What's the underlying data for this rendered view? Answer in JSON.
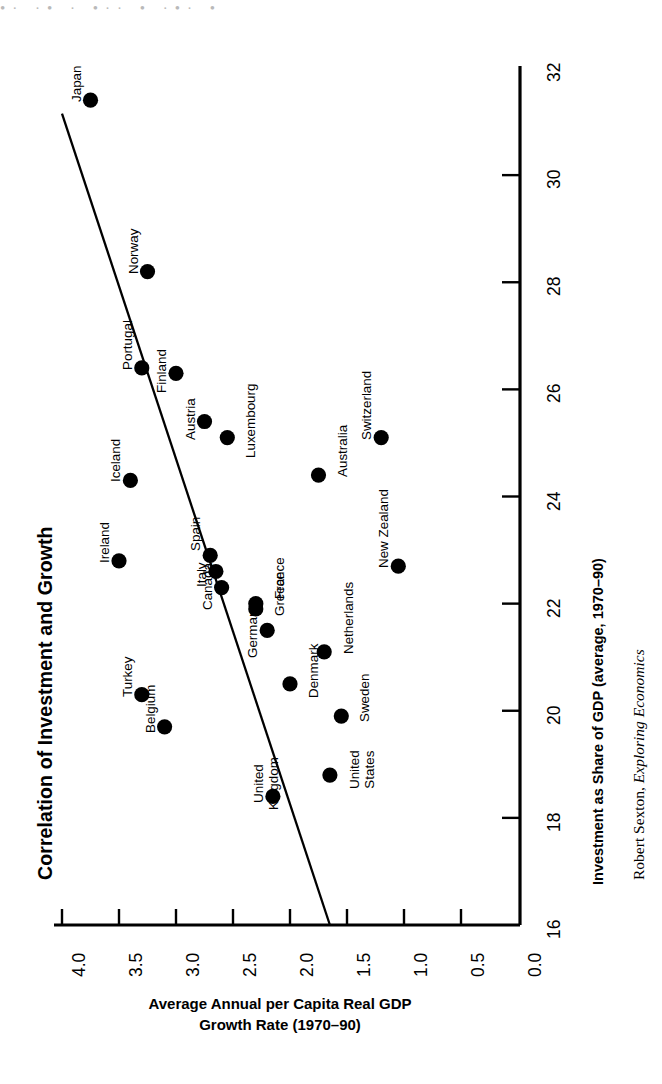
{
  "scan_artifact": "•· ·• · •·· • ·•· •",
  "chart_title": "Correlation of Investment and Growth",
  "source_credit_author": "Robert Sexton, ",
  "source_credit_work": "Exploring Economics",
  "axes": {
    "x_title": "Investment as Share of GDP (average, 1970–90)",
    "y_title_line1": "Average Annual per Capita Real GDP",
    "y_title_line2": "Growth Rate (1970–90)",
    "x_ticks": [
      "16",
      "18",
      "20",
      "22",
      "24",
      "26",
      "28",
      "30",
      "32"
    ],
    "y_ticks": [
      "0.0",
      "0.5",
      "1.0",
      "1.5",
      "2.0",
      "2.5",
      "3.0",
      "3.5",
      "4.0"
    ]
  },
  "chart_data": {
    "type": "scatter",
    "title": "Correlation of Investment and Growth",
    "xlabel": "Investment as Share of GDP (average, 1970–90)",
    "ylabel": "Average Annual per Capita Real GDP Growth Rate (1970–90)",
    "xlim": [
      16,
      32
    ],
    "ylim": [
      0.0,
      4.0
    ],
    "xticks": [
      16,
      18,
      20,
      22,
      24,
      26,
      28,
      30,
      32
    ],
    "yticks": [
      0.0,
      0.5,
      1.0,
      1.5,
      2.0,
      2.5,
      3.0,
      3.5,
      4.0
    ],
    "grid": false,
    "legend": "none",
    "point_color": "#000000",
    "trendline": {
      "label": "regression line",
      "x_start": 16.0,
      "y_start": 1.65,
      "x_end": 31.15,
      "y_end": 4.0
    },
    "points": [
      {
        "label": "Japan",
        "x": 31.4,
        "y": 3.75
      },
      {
        "label": "Norway",
        "x": 28.2,
        "y": 3.25
      },
      {
        "label": "Portugal",
        "x": 26.4,
        "y": 3.3
      },
      {
        "label": "Finland",
        "x": 26.3,
        "y": 3.0
      },
      {
        "label": "Austria",
        "x": 25.4,
        "y": 2.75
      },
      {
        "label": "Luxembourg",
        "x": 25.1,
        "y": 2.55
      },
      {
        "label": "Iceland",
        "x": 24.3,
        "y": 3.4
      },
      {
        "label": "Australia",
        "x": 24.4,
        "y": 1.75
      },
      {
        "label": "Switzerland",
        "x": 25.1,
        "y": 1.2
      },
      {
        "label": "Ireland",
        "x": 22.8,
        "y": 3.5
      },
      {
        "label": "Spain",
        "x": 22.9,
        "y": 2.7
      },
      {
        "label": "Italy",
        "x": 22.6,
        "y": 2.65
      },
      {
        "label": "Canada",
        "x": 22.3,
        "y": 2.6
      },
      {
        "label": "Greece",
        "x": 22.0,
        "y": 2.3
      },
      {
        "label": "France",
        "x": 21.9,
        "y": 2.3
      },
      {
        "label": "Germany",
        "x": 21.5,
        "y": 2.2
      },
      {
        "label": "Netherlands",
        "x": 21.1,
        "y": 1.7
      },
      {
        "label": "Denmark",
        "x": 20.5,
        "y": 2.0
      },
      {
        "label": "New Zealand",
        "x": 22.7,
        "y": 1.05
      },
      {
        "label": "Turkey",
        "x": 20.3,
        "y": 3.3
      },
      {
        "label": "Belgium",
        "x": 19.7,
        "y": 3.1
      },
      {
        "label": "Sweden",
        "x": 19.9,
        "y": 1.55
      },
      {
        "label": "United States",
        "x": 18.8,
        "y": 1.65
      },
      {
        "label": "United Kingdom",
        "x": 18.4,
        "y": 2.15
      }
    ]
  }
}
